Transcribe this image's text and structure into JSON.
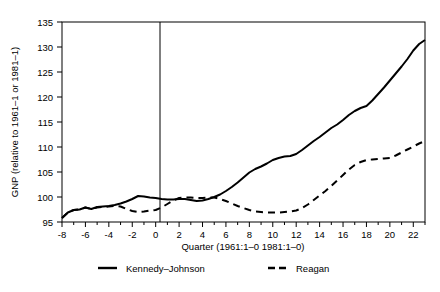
{
  "chart_data": {
    "type": "line",
    "title": "",
    "xlabel": "Quarter (1961:1–0   1981:1–0)",
    "ylabel": "GNP (relative to 1961–1 or 1981–1)",
    "xlim": [
      -8,
      23
    ],
    "ylim": [
      95,
      135
    ],
    "xticks": [
      -8,
      -6,
      -4,
      -2,
      0,
      2,
      4,
      6,
      8,
      10,
      12,
      14,
      16,
      18,
      20,
      22
    ],
    "xtick_labels": [
      "-8",
      "-6",
      "-4",
      "-2",
      "0",
      "2",
      "4",
      "6",
      "8",
      "10",
      "12",
      "14",
      "16",
      "18",
      "20",
      "22"
    ],
    "xtick_minor_step": 1,
    "yticks": [
      95,
      100,
      105,
      110,
      115,
      120,
      125,
      130,
      135
    ],
    "ytick_labels": [
      "95",
      "100",
      "105",
      "110",
      "115",
      "120",
      "125",
      "130",
      "135"
    ],
    "grid": false,
    "legend_position": "below-axis",
    "reference_line_x": 0,
    "x": [
      -8,
      -7.5,
      -7,
      -6.5,
      -6,
      -5.5,
      -5,
      -4.5,
      -4,
      -3.5,
      -3,
      -2.5,
      -2,
      -1.5,
      -1,
      -0.5,
      0,
      0.5,
      1,
      1.5,
      2,
      2.5,
      3,
      3.5,
      4,
      4.5,
      5,
      5.5,
      6,
      6.5,
      7,
      7.5,
      8,
      8.5,
      9,
      9.5,
      10,
      10.5,
      11,
      11.5,
      12,
      12.5,
      13,
      13.5,
      14,
      14.5,
      15,
      15.5,
      16,
      16.5,
      17,
      17.5,
      18,
      18.5,
      19,
      19.5,
      20,
      20.5,
      21,
      21.5,
      22,
      22.5,
      23
    ],
    "series": [
      {
        "name": "Kennedy–Johnson",
        "style": "solid",
        "color": "#000000",
        "values": [
          95.8,
          96.9,
          97.4,
          97.5,
          97.9,
          97.6,
          98.0,
          98.1,
          98.2,
          98.4,
          98.7,
          99.1,
          99.6,
          100.2,
          100.1,
          99.9,
          99.8,
          99.6,
          99.5,
          99.5,
          99.6,
          99.6,
          99.4,
          99.2,
          99.3,
          99.6,
          100.0,
          100.5,
          101.2,
          102.0,
          102.9,
          103.9,
          104.9,
          105.6,
          106.1,
          106.7,
          107.4,
          107.8,
          108.1,
          108.2,
          108.6,
          109.4,
          110.3,
          111.2,
          112.0,
          112.9,
          113.8,
          114.5,
          115.4,
          116.4,
          117.2,
          117.8,
          118.2,
          119.3,
          120.6,
          121.9,
          123.3,
          124.7,
          126.1,
          127.6,
          129.3,
          130.6,
          131.4
        ]
      },
      {
        "name": "Reagan",
        "style": "dashed",
        "color": "#000000",
        "values": [
          95.8,
          96.9,
          97.4,
          97.5,
          97.9,
          97.6,
          97.9,
          98.0,
          98.1,
          98.2,
          98.1,
          97.6,
          97.2,
          97.0,
          97.1,
          97.3,
          97.4,
          97.9,
          98.6,
          99.3,
          99.8,
          99.9,
          99.9,
          99.8,
          99.8,
          99.9,
          99.9,
          99.6,
          99.2,
          98.7,
          98.2,
          97.8,
          97.4,
          97.1,
          97.0,
          96.9,
          96.9,
          96.9,
          97.0,
          97.1,
          97.3,
          97.8,
          98.5,
          99.4,
          100.3,
          101.2,
          102.2,
          103.3,
          104.4,
          105.5,
          106.4,
          107.0,
          107.4,
          107.5,
          107.6,
          107.7,
          107.8,
          108.3,
          108.9,
          109.5,
          110.1,
          110.7,
          111.2
        ]
      }
    ],
    "series_tail": {
      "note_x": [
        23.5,
        24,
        24.5,
        25,
        25.5,
        26,
        26.5,
        27,
        27.5,
        28,
        28.5,
        29,
        29.5,
        30,
        30.5,
        31
      ],
      "kennedy_johnson": [
        132.0,
        132.5,
        132.9,
        133.2,
        133.4,
        133.6,
        133.8,
        134.0
      ],
      "reagan": [
        111.7,
        112.2,
        112.7,
        113.1,
        113.5,
        113.9,
        114.3,
        114.7
      ]
    }
  },
  "legend": {
    "entries": [
      {
        "label": "Kennedy–Johnson",
        "style": "solid"
      },
      {
        "label": "Reagan",
        "style": "dashed"
      }
    ]
  }
}
